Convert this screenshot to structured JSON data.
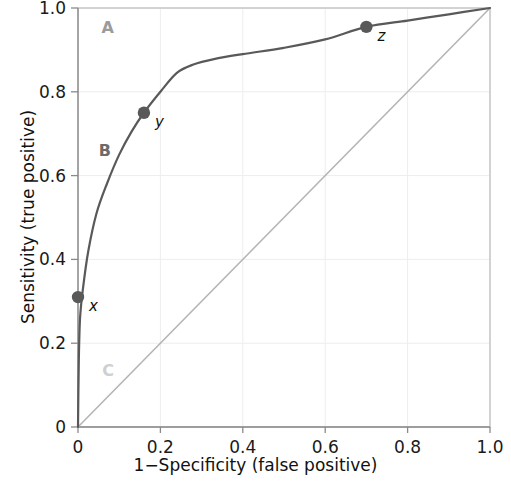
{
  "chart_data": {
    "type": "line",
    "title": "",
    "xlabel": "1−Specificity (false positive)",
    "ylabel": "Sensitivity (true positive)",
    "xlim": [
      0,
      1
    ],
    "ylim": [
      0,
      1
    ],
    "grid": true,
    "legend": "none",
    "x_ticks": [
      "0",
      "0.2",
      "0.4",
      "0.6",
      "0.8",
      "1.0"
    ],
    "x_tick_values": [
      0,
      0.2,
      0.4,
      0.6,
      0.8,
      1.0
    ],
    "y_ticks": [
      "0",
      "0.2",
      "0.4",
      "0.6",
      "0.8",
      "1.0"
    ],
    "y_tick_values": [
      0,
      0.2,
      0.4,
      0.6,
      0.8,
      1.0
    ],
    "series": [
      {
        "name": "ROC curve",
        "kind": "line",
        "color": "#595959",
        "x": [
          0.0,
          0.002,
          0.005,
          0.012,
          0.025,
          0.045,
          0.07,
          0.1,
          0.13,
          0.16,
          0.2,
          0.24,
          0.28,
          0.33,
          0.4,
          0.5,
          0.6,
          0.7,
          0.8,
          0.9,
          1.0
        ],
        "values": [
          0.0,
          0.16,
          0.26,
          0.33,
          0.42,
          0.51,
          0.58,
          0.65,
          0.705,
          0.75,
          0.8,
          0.845,
          0.865,
          0.878,
          0.89,
          0.905,
          0.925,
          0.955,
          0.97,
          0.985,
          1.0
        ]
      },
      {
        "name": "Chance diagonal",
        "kind": "line",
        "color": "#b5b5b5",
        "x": [
          0.0,
          1.0
        ],
        "values": [
          0.0,
          1.0
        ]
      }
    ],
    "points": [
      {
        "id": "x",
        "label": "x",
        "x": 0.0,
        "y": 0.31,
        "color": "#595959"
      },
      {
        "id": "y",
        "label": "y",
        "x": 0.16,
        "y": 0.75,
        "color": "#595959"
      },
      {
        "id": "z",
        "label": "z",
        "x": 0.7,
        "y": 0.955,
        "color": "#595959"
      }
    ],
    "annotations": [
      {
        "id": "region-a",
        "text": "A",
        "x": 0.072,
        "y": 0.955,
        "color": "#9b9b9b"
      },
      {
        "id": "region-b",
        "text": "B",
        "x": 0.065,
        "y": 0.662,
        "color": "#6b6b6b"
      },
      {
        "id": "region-c",
        "text": "C",
        "x": 0.073,
        "y": 0.137,
        "color": "#cfcfcf"
      }
    ]
  },
  "axes": {
    "x_title": "1−Specificity (false positive)",
    "y_title": "Sensitivity (true positive)"
  },
  "colors": {
    "curve": "#595959",
    "diagonal": "#b5b5b5",
    "box": "#c4c4c4",
    "grid": "#ededed",
    "axis": "#8a8a8a",
    "text": "#111111"
  }
}
